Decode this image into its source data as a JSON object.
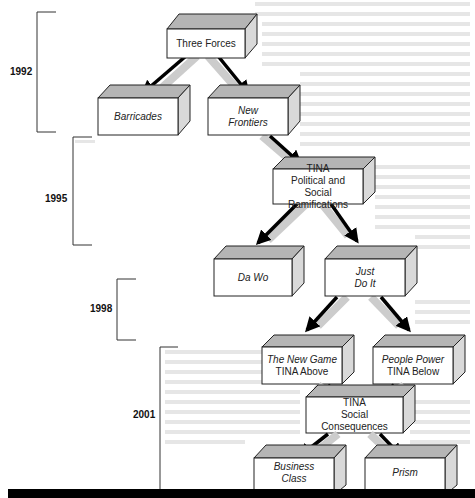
{
  "timeline": [
    {
      "year": "1992"
    },
    {
      "year": "1995"
    },
    {
      "year": "1998"
    },
    {
      "year": "2001"
    }
  ],
  "nodes": {
    "three_forces": {
      "lines": [
        "Three Forces"
      ],
      "italic": [
        false
      ]
    },
    "barricades": {
      "lines": [
        "Barricades"
      ],
      "italic": [
        true
      ]
    },
    "new_frontiers": {
      "lines": [
        "New",
        "Frontiers"
      ],
      "italic": [
        true,
        true
      ]
    },
    "tina_political": {
      "lines": [
        "TINA",
        "Political and",
        "Social Ramifications"
      ],
      "italic": [
        false,
        false,
        false
      ]
    },
    "da_wo": {
      "lines": [
        "Da Wo"
      ],
      "italic": [
        true
      ]
    },
    "just_do_it": {
      "lines": [
        "Just",
        "Do It"
      ],
      "italic": [
        true,
        true
      ]
    },
    "new_game": {
      "lines": [
        "The New Game",
        "TINA Above"
      ],
      "italic": [
        true,
        false
      ]
    },
    "people_power": {
      "lines": [
        "People Power",
        "TINA Below"
      ],
      "italic": [
        true,
        false
      ]
    },
    "tina_social": {
      "lines": [
        "TINA",
        "Social",
        "Consequences"
      ],
      "italic": [
        false,
        false,
        false
      ]
    },
    "business_class": {
      "lines": [
        "Business",
        "Class"
      ],
      "italic": [
        true,
        true
      ]
    },
    "prism": {
      "lines": [
        "Prism"
      ],
      "italic": [
        true
      ]
    }
  },
  "edges": [
    [
      "three_forces",
      "barricades"
    ],
    [
      "three_forces",
      "new_frontiers"
    ],
    [
      "new_frontiers",
      "tina_political"
    ],
    [
      "tina_political",
      "da_wo"
    ],
    [
      "tina_political",
      "just_do_it"
    ],
    [
      "just_do_it",
      "new_game"
    ],
    [
      "just_do_it",
      "people_power"
    ],
    [
      "new_game",
      "tina_social"
    ],
    [
      "people_power",
      "tina_social"
    ],
    [
      "tina_social",
      "business_class"
    ],
    [
      "tina_social",
      "prism"
    ]
  ],
  "colors": {
    "box_front": "#ffffff",
    "box_top": "#b8b8b8",
    "box_side": "#d8d8d8",
    "outline": "#222222",
    "arrow_dark": "#000000",
    "arrow_light": "#d0d0d0",
    "bottom_bar": "#000000"
  }
}
